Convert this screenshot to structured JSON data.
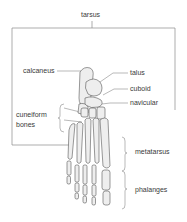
{
  "diagram": {
    "labels": {
      "tarsus": "tarsus",
      "calcaneus": "calcaneus",
      "talus": "talus",
      "cuboid": "cuboid",
      "navicular": "navicular",
      "cuneiform_line1": "cuneiform",
      "cuneiform_line2": "bones",
      "metatarsus": "metatarsus",
      "phalanges": "phalanges"
    },
    "colors": {
      "line": "#8a8a8a",
      "bone_fill": "#eeeeee",
      "bone_stroke": "#555555",
      "text": "#3a3a3a"
    }
  }
}
